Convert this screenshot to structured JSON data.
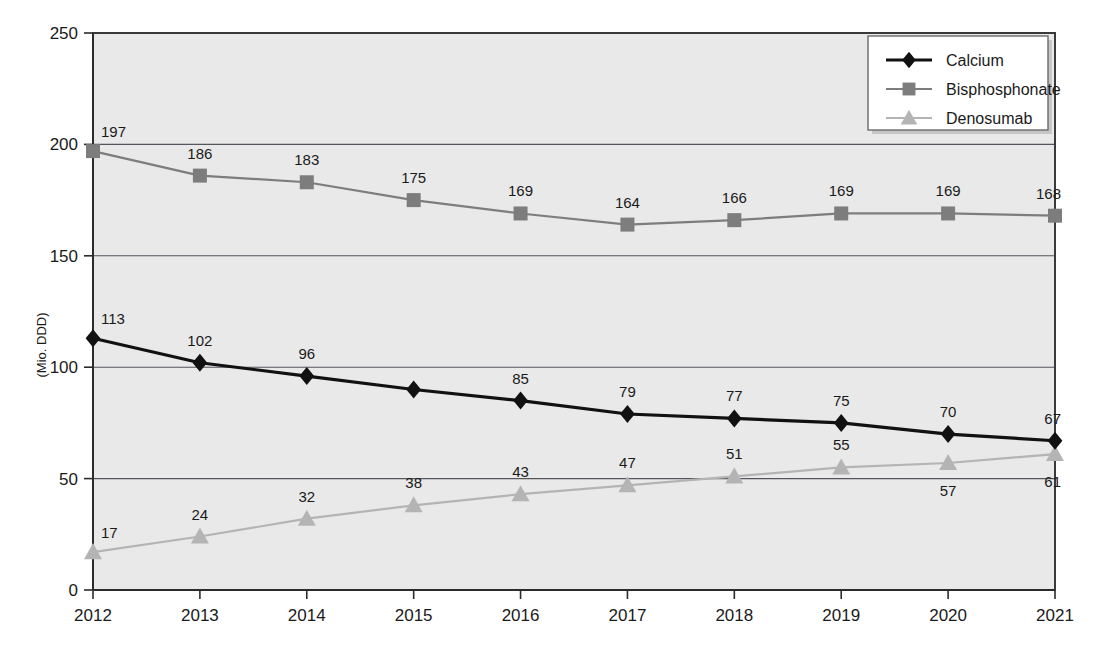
{
  "chart_data": {
    "type": "line",
    "title": "",
    "xlabel": "",
    "ylabel": "(Mio. DDD)",
    "categories": [
      "2012",
      "2013",
      "2014",
      "2015",
      "2016",
      "2017",
      "2018",
      "2019",
      "2020",
      "2021"
    ],
    "ylim": [
      0,
      250
    ],
    "yticks": [
      0,
      50,
      100,
      150,
      200,
      250
    ],
    "ytick_labels": [
      "0",
      "50",
      "100",
      "150",
      "200",
      "250"
    ],
    "grid": true,
    "grid_axis": "y",
    "legend_position": "top-right",
    "series": [
      {
        "name": "Calcium",
        "marker": "diamond",
        "color": "#111111",
        "values": [
          113,
          102,
          96,
          90,
          85,
          79,
          77,
          75,
          70,
          67
        ],
        "labels": [
          "113",
          "102",
          "96",
          "",
          "85",
          "79",
          "77",
          "75",
          "70",
          "67"
        ],
        "label_positions": [
          "above",
          "above",
          "above",
          "none",
          "above",
          "above",
          "above",
          "above",
          "above",
          "above"
        ]
      },
      {
        "name": "Bisphosphonate",
        "marker": "square",
        "color": "#7d7d7d",
        "values": [
          197,
          186,
          183,
          175,
          169,
          164,
          166,
          169,
          169,
          168
        ],
        "labels": [
          "197",
          "186",
          "183",
          "175",
          "169",
          "164",
          "166",
          "169",
          "169",
          "168"
        ],
        "label_positions": [
          "above",
          "above",
          "above",
          "above",
          "above",
          "above",
          "above",
          "above",
          "above",
          "above"
        ]
      },
      {
        "name": "Denosumab",
        "marker": "triangle",
        "color": "#b4b4b4",
        "values": [
          17,
          24,
          32,
          38,
          43,
          47,
          51,
          55,
          57,
          61
        ],
        "labels": [
          "17",
          "24",
          "32",
          "38",
          "43",
          "47",
          "51",
          "55",
          "57",
          "61"
        ],
        "label_positions": [
          "above",
          "above",
          "above",
          "above",
          "above",
          "above",
          "above",
          "above",
          "below",
          "below"
        ]
      }
    ]
  },
  "legend": {
    "entries": [
      {
        "label": "Calcium",
        "marker": "diamond-icon",
        "color": "#111111"
      },
      {
        "label": "Bisphosphonate",
        "marker": "square-icon",
        "color": "#7d7d7d"
      },
      {
        "label": "Denosumab",
        "marker": "triangle-icon",
        "color": "#b4b4b4"
      }
    ]
  },
  "colors": {
    "plot_background": "#e9e9e9",
    "page_background": "#ffffff",
    "axis": "#2b2b2b",
    "gridline": "#55555e",
    "calcium": "#111111",
    "bisphosphonate": "#7d7d7d",
    "denosumab": "#b4b4b4"
  }
}
